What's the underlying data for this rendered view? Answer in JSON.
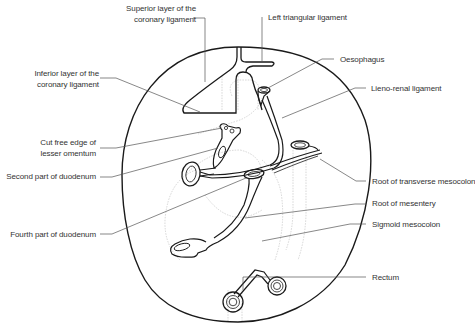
{
  "diagram": {
    "type": "anatomical-schematic",
    "colors": {
      "outline": "#1a1a1a",
      "leader": "#555555",
      "faint": "#bbbbbb",
      "text": "#333333"
    },
    "labels": {
      "superior_layer": [
        "Superior layer of the",
        "coronary ligament"
      ],
      "left_triangular": "Left triangular ligament",
      "inferior_layer": [
        "Inferior layer of the",
        "coronary ligament"
      ],
      "oesophagus": "Oesophagus",
      "lieno_renal": "Lieno-renal ligament",
      "cut_free_edge": [
        "Cut free edge of",
        "lesser omentum"
      ],
      "second_part_duodenum": "Second part of duodenum",
      "root_transverse_mesocolon": "Root of transverse mesocolon",
      "root_mesentery": "Root of mesentery",
      "fourth_part_duodenum": "Fourth part of duodenum",
      "sigmoid_mesocolon": "Sigmoid mesocolon",
      "rectum": "Rectum"
    }
  }
}
